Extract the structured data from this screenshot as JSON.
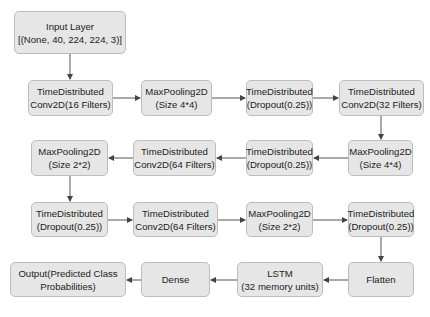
{
  "diagram": {
    "type": "model-architecture-flowchart",
    "colors": {
      "node_fill": "#e6e6e6",
      "node_border": "#bdbdbd",
      "edge": "#444444",
      "text": "#222222"
    },
    "nodes": [
      {
        "id": "input",
        "line1": "Input Layer",
        "line2": "[(None, 40, 224, 224, 3)]",
        "x": 14,
        "y": 11,
        "w": 112,
        "h": 43
      },
      {
        "id": "conv16",
        "line1": "TimeDistributed",
        "line2": "Conv2D(16 Filters)",
        "x": 28,
        "y": 80,
        "w": 85,
        "h": 36
      },
      {
        "id": "pool44a",
        "line1": "MaxPooling2D",
        "line2": "(Size 4*4)",
        "x": 141,
        "y": 80,
        "w": 71,
        "h": 36
      },
      {
        "id": "drop1",
        "line1": "TimeDistributed",
        "line2": "(Dropout(0.25))",
        "x": 246,
        "y": 80,
        "w": 67,
        "h": 36
      },
      {
        "id": "conv32",
        "line1": "TimeDistributed",
        "line2": "Conv2D(32 Filters)",
        "x": 339,
        "y": 80,
        "w": 85,
        "h": 36
      },
      {
        "id": "pool44b",
        "line1": "MaxPooling2D",
        "line2": "(Size 4*4)",
        "x": 348,
        "y": 140,
        "w": 65,
        "h": 36
      },
      {
        "id": "drop2",
        "line1": "TimeDistributed",
        "line2": "(Dropout(0.25))",
        "x": 246,
        "y": 140,
        "w": 67,
        "h": 36
      },
      {
        "id": "conv64a",
        "line1": "TimeDistributed",
        "line2": "Conv2D(64 Filters)",
        "x": 133,
        "y": 140,
        "w": 83,
        "h": 36
      },
      {
        "id": "pool22a",
        "line1": "MaxPooling2D",
        "line2": "(Size 2*2)",
        "x": 31,
        "y": 140,
        "w": 77,
        "h": 36
      },
      {
        "id": "drop3",
        "line1": "TimeDistributed",
        "line2": "(Dropout(0.25))",
        "x": 31,
        "y": 202,
        "w": 77,
        "h": 35
      },
      {
        "id": "conv64b",
        "line1": "TimeDistributed",
        "line2": "Conv2D(64 Filters)",
        "x": 133,
        "y": 202,
        "w": 85,
        "h": 35
      },
      {
        "id": "pool22b",
        "line1": "MaxPooling2D",
        "line2": "(Size 2*2)",
        "x": 246,
        "y": 202,
        "w": 67,
        "h": 35
      },
      {
        "id": "drop4",
        "line1": "TimeDistributed",
        "line2": "(Dropout(0.25))",
        "x": 348,
        "y": 202,
        "w": 66,
        "h": 35
      },
      {
        "id": "flatten",
        "line1": "Flatten",
        "line2": "",
        "x": 348,
        "y": 262,
        "w": 66,
        "h": 35
      },
      {
        "id": "lstm",
        "line1": "LSTM",
        "line2": "(32 memory units)",
        "x": 237,
        "y": 262,
        "w": 86,
        "h": 35
      },
      {
        "id": "dense",
        "line1": "Dense",
        "line2": "",
        "x": 141,
        "y": 262,
        "w": 69,
        "h": 35
      },
      {
        "id": "output",
        "line1": "Output(Predicted Class",
        "line2": "Probabilities)",
        "x": 10,
        "y": 262,
        "w": 116,
        "h": 35
      }
    ],
    "edges": [
      [
        "input",
        "conv16"
      ],
      [
        "conv16",
        "pool44a"
      ],
      [
        "pool44a",
        "drop1"
      ],
      [
        "drop1",
        "conv32"
      ],
      [
        "conv32",
        "pool44b"
      ],
      [
        "pool44b",
        "drop2"
      ],
      [
        "drop2",
        "conv64a"
      ],
      [
        "conv64a",
        "pool22a"
      ],
      [
        "pool22a",
        "drop3"
      ],
      [
        "drop3",
        "conv64b"
      ],
      [
        "conv64b",
        "pool22b"
      ],
      [
        "pool22b",
        "drop4"
      ],
      [
        "drop4",
        "flatten"
      ],
      [
        "flatten",
        "lstm"
      ],
      [
        "lstm",
        "dense"
      ],
      [
        "dense",
        "output"
      ]
    ]
  }
}
